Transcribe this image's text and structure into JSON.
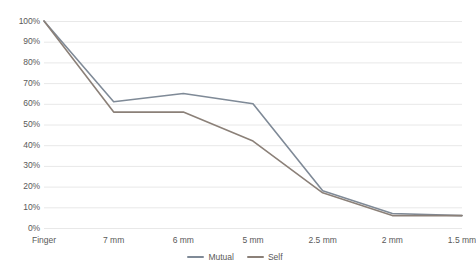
{
  "chart_data": {
    "type": "line",
    "title": "",
    "xlabel": "",
    "ylabel": "",
    "categories": [
      "Finger",
      "7 mm",
      "6 mm",
      "5 mm",
      "2.5 mm",
      "2 mm",
      "1.5 mm"
    ],
    "ylim": [
      0,
      100
    ],
    "ytick_labels": [
      "100%",
      "90%",
      "80%",
      "70%",
      "60%",
      "50%",
      "40%",
      "30%",
      "20%",
      "10%",
      "0%"
    ],
    "ytick_values": [
      100,
      90,
      80,
      70,
      60,
      50,
      40,
      30,
      20,
      10,
      0
    ],
    "grid": true,
    "legend_position": "bottom-center",
    "series": [
      {
        "name": "Mutual",
        "color": "#7f8a97",
        "values": [
          100,
          61,
          65,
          60,
          18,
          7,
          6
        ]
      },
      {
        "name": "Self",
        "color": "#8b8078",
        "values": [
          100,
          56,
          56,
          42,
          17,
          6,
          6
        ]
      }
    ]
  },
  "legend": {
    "items": [
      {
        "label": "Mutual",
        "color": "#7f8a97"
      },
      {
        "label": "Self",
        "color": "#8b8078"
      }
    ]
  },
  "style": {
    "grid_color": "#e8e8e8",
    "axis_text_color": "#595959",
    "background": "#ffffff"
  }
}
